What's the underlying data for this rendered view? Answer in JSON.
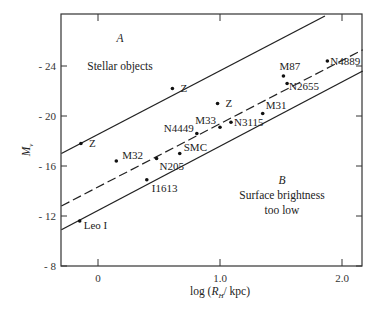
{
  "chart_data": {
    "type": "scatter",
    "title": "",
    "xlabel": "log (R_H / kpc)",
    "ylabel": "M_v",
    "xlim": [
      -0.3,
      2.17
    ],
    "ylim": [
      -8,
      -28
    ],
    "x_ticks": [
      0,
      1.0,
      2.0
    ],
    "x_tick_labels": [
      "0",
      "1.0",
      "2.0"
    ],
    "y_ticks": [
      -8,
      -12,
      -16,
      -20,
      -24
    ],
    "y_tick_labels": [
      "- 8",
      "- 12",
      "- 16",
      "- 20",
      "- 24"
    ],
    "grid": false,
    "points": [
      {
        "label": "Z",
        "x": -0.14,
        "y": -17.8
      },
      {
        "label": "Z",
        "x": 0.61,
        "y": -22.2
      },
      {
        "label": "Z",
        "x": 0.98,
        "y": -21.0
      },
      {
        "label": "M32",
        "x": 0.15,
        "y": -16.4
      },
      {
        "label": "N205",
        "x": 0.48,
        "y": -16.6
      },
      {
        "label": "SMC",
        "x": 0.67,
        "y": -17.0
      },
      {
        "label": "N4449",
        "x": 0.81,
        "y": -18.6
      },
      {
        "label": "M33",
        "x": 1.0,
        "y": -19.1
      },
      {
        "label": "N3115",
        "x": 1.09,
        "y": -19.5
      },
      {
        "label": "M31",
        "x": 1.35,
        "y": -20.2
      },
      {
        "label": "M87",
        "x": 1.52,
        "y": -23.2
      },
      {
        "label": "N2655",
        "x": 1.55,
        "y": -22.6
      },
      {
        "label": "N4889",
        "x": 1.88,
        "y": -24.4
      },
      {
        "label": "I1613",
        "x": 0.4,
        "y": -14.9
      },
      {
        "label": "Leo I",
        "x": -0.15,
        "y": -11.6
      }
    ],
    "lines": [
      {
        "name": "upper boundary",
        "style": "solid",
        "x": [
          -0.3,
          1.86
        ],
        "y": [
          -17.0,
          -28.0
        ]
      },
      {
        "name": "mean relation",
        "style": "dashed",
        "x": [
          -0.3,
          2.17
        ],
        "y": [
          -12.8,
          -25.3
        ]
      },
      {
        "name": "lower boundary",
        "style": "solid",
        "x": [
          -0.3,
          2.17
        ],
        "y": [
          -10.9,
          -23.6
        ]
      }
    ],
    "annotations": [
      {
        "text": "A",
        "x": 0.25,
        "y": -25.0
      },
      {
        "text": "Stellar objects",
        "x": 0.25,
        "y": -24.0
      },
      {
        "text": "B",
        "x": 1.5,
        "y": -13.6
      },
      {
        "text": "Surface brightness",
        "x": 1.5,
        "y": -12.6
      },
      {
        "text": "too low",
        "x": 1.5,
        "y": -11.7
      }
    ]
  },
  "labels": {
    "region_a_letter": "A",
    "region_a_text": "Stellar objects",
    "region_b_letter": "B",
    "region_b_line1": "Surface brightness",
    "region_b_line2": "too low",
    "xlabel_pre": "log (",
    "xlabel_R": "R",
    "xlabel_sub": "H",
    "xlabel_post": "/ kpc)",
    "ylabel_M": "M",
    "ylabel_sub": "v"
  }
}
